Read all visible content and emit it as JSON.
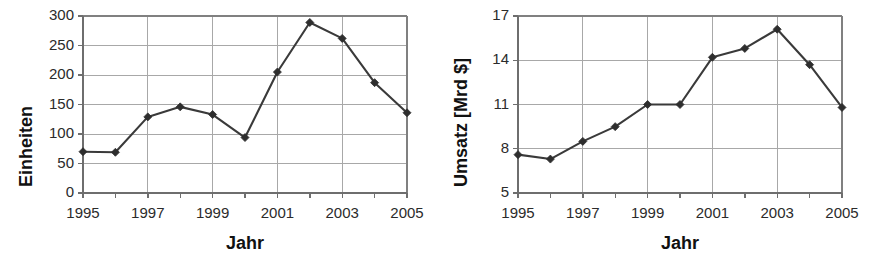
{
  "figure": {
    "background_color": "#ffffff",
    "line_color": "#3a3a3a",
    "marker_color": "#2e2e2e",
    "grid_color": "#a8a8a8",
    "axis_color": "#808080",
    "text_color": "#1a1a1a"
  },
  "chart_data": [
    {
      "type": "line",
      "title": "",
      "xlabel": "Jahr",
      "ylabel": "Einheiten",
      "x": [
        1995,
        1996,
        1997,
        1998,
        1999,
        2000,
        2001,
        2002,
        2003,
        2004,
        2005
      ],
      "values": [
        70,
        69,
        129,
        146,
        133,
        94,
        205,
        289,
        262,
        187,
        136
      ],
      "xtick_labels": [
        "1995",
        "1997",
        "1999",
        "2001",
        "2003",
        "2005"
      ],
      "xtick_values": [
        1995,
        1997,
        1999,
        2001,
        2003,
        2005
      ],
      "ytick_labels": [
        "0",
        "50",
        "100",
        "150",
        "200",
        "250",
        "300"
      ],
      "ytick_values": [
        0,
        50,
        100,
        150,
        200,
        250,
        300
      ],
      "xlim": [
        1995,
        2005
      ],
      "ylim": [
        0,
        300
      ],
      "grid": true,
      "legend": false,
      "marker": "diamond"
    },
    {
      "type": "line",
      "title": "",
      "xlabel": "Jahr",
      "ylabel": "Umsatz [Mrd $]",
      "x": [
        1995,
        1996,
        1997,
        1998,
        1999,
        2000,
        2001,
        2002,
        2003,
        2004,
        2005
      ],
      "values": [
        7.6,
        7.3,
        8.5,
        9.5,
        11.0,
        11.0,
        14.2,
        14.8,
        16.1,
        13.7,
        10.8
      ],
      "xtick_labels": [
        "1995",
        "1997",
        "1999",
        "2001",
        "2003",
        "2005"
      ],
      "xtick_values": [
        1995,
        1997,
        1999,
        2001,
        2003,
        2005
      ],
      "ytick_labels": [
        "5",
        "8",
        "11",
        "14",
        "17"
      ],
      "ytick_values": [
        5,
        8,
        11,
        14,
        17
      ],
      "xlim": [
        1995,
        2005
      ],
      "ylim": [
        5,
        17
      ],
      "grid": true,
      "legend": false,
      "marker": "diamond"
    }
  ]
}
